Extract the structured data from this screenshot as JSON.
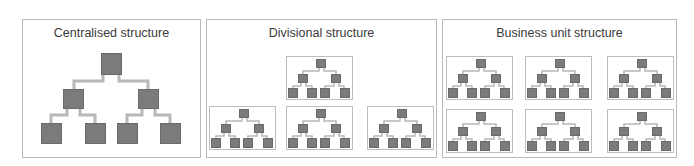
{
  "panels": [
    {
      "title": "Centralised structure",
      "units": 1
    },
    {
      "title": "Divisional structure",
      "units": 4
    },
    {
      "title": "Business unit structure",
      "units": 6
    }
  ],
  "colors": {
    "node": "#7b7b7b",
    "connector": "#b8b8b8",
    "border": "#b9b9b9",
    "text": "#3a3a3a"
  }
}
